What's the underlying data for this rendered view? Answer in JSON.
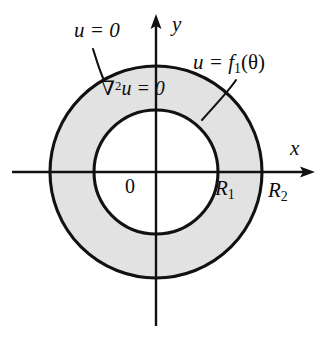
{
  "figure": {
    "background_color": "#ffffff",
    "stroke_color": "#111111",
    "annulus_fill_color": "#e2e2e2",
    "inner_fill_color": "#ffffff"
  },
  "geometry": {
    "center_x": 156,
    "center_y": 172,
    "inner_radius": 62,
    "outer_radius": 106
  },
  "axes": {
    "x_label": "x",
    "y_label": "y",
    "origin_label": "0"
  },
  "labels": {
    "outer_boundary_condition": "u = 0",
    "inner_boundary_condition_prefix": "u = f",
    "inner_boundary_condition_subscript": "1",
    "inner_boundary_condition_arg": "(θ)",
    "pde_operator": "∇",
    "pde_power": "2",
    "pde_rest": "u = 0",
    "inner_radius_symbol": "R",
    "inner_radius_subscript": "1",
    "outer_radius_symbol": "R",
    "outer_radius_subscript": "2"
  }
}
